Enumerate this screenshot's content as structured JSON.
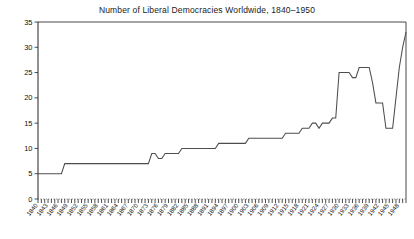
{
  "chart_data": {
    "type": "line",
    "title": "Number of Liberal Democracies Worldwide, 1840–1950",
    "xlabel": "",
    "ylabel": "",
    "xlim": [
      1840,
      1950
    ],
    "ylim": [
      0,
      35
    ],
    "yticks": [
      0,
      5,
      10,
      15,
      20,
      25,
      30,
      35
    ],
    "ytick_labels": [
      "0",
      "5",
      "10",
      "15",
      "20",
      "25",
      "30",
      "35"
    ],
    "grid": false,
    "legend": false,
    "line_color": "#4d4d4d",
    "background_color": "#ffffff",
    "x_tick_interval_years": 1,
    "x_label_interval_years": 3,
    "xtick_labels": [
      "1840",
      "1843",
      "1846",
      "1849",
      "1852",
      "1855",
      "1858",
      "1861",
      "1864",
      "1867",
      "1870",
      "1873",
      "1876",
      "1879",
      "1882",
      "1885",
      "1888",
      "1891",
      "1894",
      "1897",
      "1900",
      "1903",
      "1906",
      "1909",
      "1912",
      "1915",
      "1918",
      "1921",
      "1924",
      "1927",
      "1930",
      "1933",
      "1936",
      "1939",
      "1942",
      "1945",
      "1948"
    ],
    "x": [
      1840,
      1841,
      1842,
      1843,
      1844,
      1845,
      1846,
      1847,
      1848,
      1849,
      1850,
      1851,
      1852,
      1853,
      1854,
      1855,
      1856,
      1857,
      1858,
      1859,
      1860,
      1861,
      1862,
      1863,
      1864,
      1865,
      1866,
      1867,
      1868,
      1869,
      1870,
      1871,
      1872,
      1873,
      1874,
      1875,
      1876,
      1877,
      1878,
      1879,
      1880,
      1881,
      1882,
      1883,
      1884,
      1885,
      1886,
      1887,
      1888,
      1889,
      1890,
      1891,
      1892,
      1893,
      1894,
      1895,
      1896,
      1897,
      1898,
      1899,
      1900,
      1901,
      1902,
      1903,
      1904,
      1905,
      1906,
      1907,
      1908,
      1909,
      1910,
      1911,
      1912,
      1913,
      1914,
      1915,
      1916,
      1917,
      1918,
      1919,
      1920,
      1921,
      1922,
      1923,
      1924,
      1925,
      1926,
      1927,
      1928,
      1929,
      1930,
      1931,
      1932,
      1933,
      1934,
      1935,
      1936,
      1937,
      1938,
      1939,
      1940,
      1941,
      1942,
      1943,
      1944,
      1945,
      1946,
      1947,
      1948,
      1949,
      1950
    ],
    "values": [
      5,
      5,
      5,
      5,
      5,
      5,
      5,
      5,
      7,
      7,
      7,
      7,
      7,
      7,
      7,
      7,
      7,
      7,
      7,
      7,
      7,
      7,
      7,
      7,
      7,
      7,
      7,
      7,
      7,
      7,
      7,
      7,
      7,
      7,
      9,
      9,
      8,
      8,
      9,
      9,
      9,
      9,
      9,
      10,
      10,
      10,
      10,
      10,
      10,
      10,
      10,
      10,
      10,
      10,
      11,
      11,
      11,
      11,
      11,
      11,
      11,
      11,
      11,
      12,
      12,
      12,
      12,
      12,
      12,
      12,
      12,
      12,
      12,
      12,
      13,
      13,
      13,
      13,
      13,
      14,
      14,
      14,
      15,
      15,
      14,
      15,
      15,
      15,
      16,
      16,
      25,
      25,
      25,
      25,
      24,
      24,
      26,
      26,
      26,
      26,
      23,
      19,
      19,
      19,
      14,
      14,
      14,
      20,
      26,
      30,
      33
    ],
    "series_name": "Liberal democracies"
  }
}
